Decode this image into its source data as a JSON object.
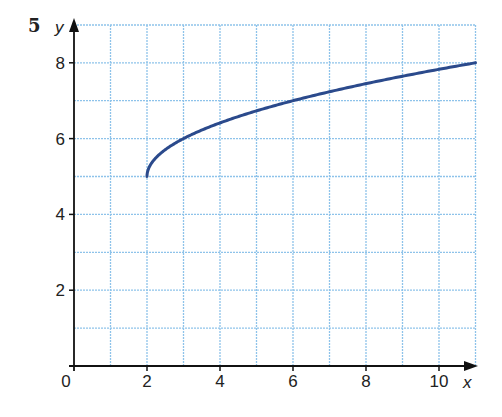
{
  "question_number": "5",
  "chart_data": {
    "type": "line",
    "title": "",
    "xlabel": "x",
    "ylabel": "y",
    "xlim": [
      0,
      11
    ],
    "ylim": [
      0,
      9
    ],
    "x_ticks": [
      0,
      2,
      4,
      6,
      8,
      10
    ],
    "y_ticks": [
      2,
      4,
      6,
      8
    ],
    "x_tick_labels": [
      "0",
      "2",
      "4",
      "6",
      "8",
      "10"
    ],
    "y_tick_labels": [
      "2",
      "4",
      "6",
      "8"
    ],
    "grid": true,
    "grid_step": 1,
    "series": [
      {
        "name": "curve",
        "color": "#2b4a8c",
        "x": [
          2,
          2.25,
          3,
          4,
          5,
          6,
          7,
          8,
          9,
          10,
          11
        ],
        "y": [
          5,
          5.5,
          6,
          6.41,
          6.73,
          7,
          7.24,
          7.45,
          7.65,
          7.83,
          8
        ]
      }
    ]
  },
  "colors": {
    "grid": "#8ec3ea",
    "axis": "#111111",
    "curve": "#2b4a8c"
  }
}
